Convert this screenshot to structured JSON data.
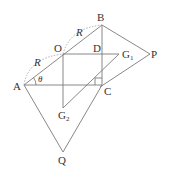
{
  "diagram": {
    "points": {
      "A": {
        "label": "A",
        "x": 24,
        "y": 85
      },
      "B": {
        "label": "B",
        "x": 102,
        "y": 25
      },
      "C": {
        "label": "C",
        "x": 102,
        "y": 85
      },
      "O": {
        "label": "O",
        "x": 63,
        "y": 54
      },
      "D": {
        "label": "D",
        "x": 102,
        "y": 54
      },
      "G1": {
        "label": "G",
        "sub": "1",
        "x": 119,
        "y": 54
      },
      "G2": {
        "label": "G",
        "sub": "2",
        "x": 63,
        "y": 108
      },
      "P": {
        "label": "P",
        "x": 150,
        "y": 54
      },
      "Q": {
        "label": "Q",
        "x": 63,
        "y": 152
      }
    },
    "radius_label_1": "R",
    "radius_label_2": "R",
    "angle_label": "θ",
    "segments": [
      "A-B",
      "B-C",
      "A-C",
      "O-G1",
      "O-G2",
      "G1-G2",
      "B-P",
      "P-C",
      "C-Q",
      "A-Q"
    ],
    "arcs": [
      "A-O dashed",
      "O-B dashed"
    ],
    "right_angle_at": "C"
  }
}
